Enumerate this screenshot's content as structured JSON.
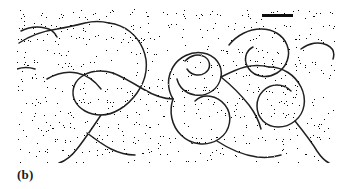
{
  "figure": {
    "panel_label": "(b)",
    "type": "electron-micrograph",
    "background_color": "#ffffff",
    "ink_color": "#101010",
    "panel": {
      "x": 17,
      "y": 9,
      "width": 318,
      "height": 154,
      "description": "Grainy high-contrast transmission electron micrograph of spread nucleic acid filaments against a speckled stain background"
    },
    "scale_bar": {
      "name": "scale-bar",
      "x": 262,
      "y": 14,
      "width": 31,
      "height": 3,
      "color": "#0d0d0d",
      "label": ""
    },
    "grain": {
      "base_frequency": 0.92,
      "octaves": 3,
      "seed": 17,
      "contrast_cut": 0.47,
      "density_description": "dense random black speckles on white field"
    },
    "filaments": [
      {
        "id": "f1",
        "name": "upper-left-strand",
        "d": "M 2 34 C 14 26 26 22 40 20 C 52 18 60 16 68 14 C 76 12 84 12 92 14"
      },
      {
        "id": "f2",
        "name": "upper-left-short-arc",
        "d": "M 4 22 C 12 18 20 17 28 19 C 34 20 38 24 40 28"
      },
      {
        "id": "f3",
        "name": "left-mid-branch",
        "d": "M 30 70 C 40 64 50 62 60 64 C 70 66 78 72 84 80"
      },
      {
        "id": "f4",
        "name": "large-central-left-loop",
        "d": "M 92 14 C 108 16 120 26 126 40 C 132 54 130 70 120 84 C 110 98 96 106 84 106 C 72 106 62 100 58 92 C 54 84 56 74 64 68 C 72 62 84 60 96 64"
      },
      {
        "id": "f5",
        "name": "central-descending-strand",
        "d": "M 96 64 C 106 68 116 74 126 80 C 136 86 146 90 156 90"
      },
      {
        "id": "f6",
        "name": "center-upper-loop",
        "d": "M 156 90 C 150 80 150 68 156 58 C 162 48 174 42 186 44 C 198 46 206 56 204 68 C 202 80 190 88 178 86 C 168 84 162 78 160 70"
      },
      {
        "id": "f7",
        "name": "center-small-loop",
        "d": "M 168 52 C 174 46 182 44 188 48 C 194 52 194 60 188 64 C 182 68 174 66 170 60"
      },
      {
        "id": "f8",
        "name": "center-branch-node-strand",
        "d": "M 204 68 C 212 64 220 60 228 58 C 236 56 244 56 252 58"
      },
      {
        "id": "f9",
        "name": "upper-right-loop",
        "d": "M 212 36 C 220 26 232 20 244 20 C 256 20 266 26 270 36 C 274 46 270 58 260 64 C 250 70 238 68 232 60 C 226 52 228 42 236 38"
      },
      {
        "id": "f10",
        "name": "right-large-loop",
        "d": "M 252 58 C 266 58 278 66 284 78 C 290 90 288 104 278 112 C 268 120 254 120 246 112 C 238 104 238 90 246 82 C 254 74 266 74 274 82"
      },
      {
        "id": "f11",
        "name": "right-descending-tail",
        "d": "M 278 112 C 286 122 294 132 300 142 C 304 148 308 152 312 154"
      },
      {
        "id": "f12",
        "name": "lower-center-loop",
        "d": "M 156 90 C 152 102 154 116 164 126 C 174 136 190 138 202 130 C 214 122 216 106 208 96 C 200 86 186 84 178 92"
      },
      {
        "id": "f13",
        "name": "lower-left-long-strand",
        "d": "M 84 106 C 76 118 68 130 60 140 C 54 148 48 152 42 154"
      },
      {
        "id": "f14",
        "name": "lower-left-branch",
        "d": "M 70 124 C 78 130 86 136 94 140 C 102 144 110 146 118 146"
      },
      {
        "id": "f15",
        "name": "mid-right-crossing",
        "d": "M 204 68 C 214 76 224 86 232 96 C 238 104 242 112 244 120"
      },
      {
        "id": "f16",
        "name": "far-right-upper-arc",
        "d": "M 284 40 C 292 34 302 32 310 36 C 316 39 318 44 316 50"
      },
      {
        "id": "f17",
        "name": "left-edge-stub",
        "d": "M 0 60 C 6 58 12 58 18 60"
      },
      {
        "id": "f18",
        "name": "lower-right-arc",
        "d": "M 200 132 C 212 140 226 146 240 148 C 250 149 258 148 264 146"
      }
    ]
  }
}
